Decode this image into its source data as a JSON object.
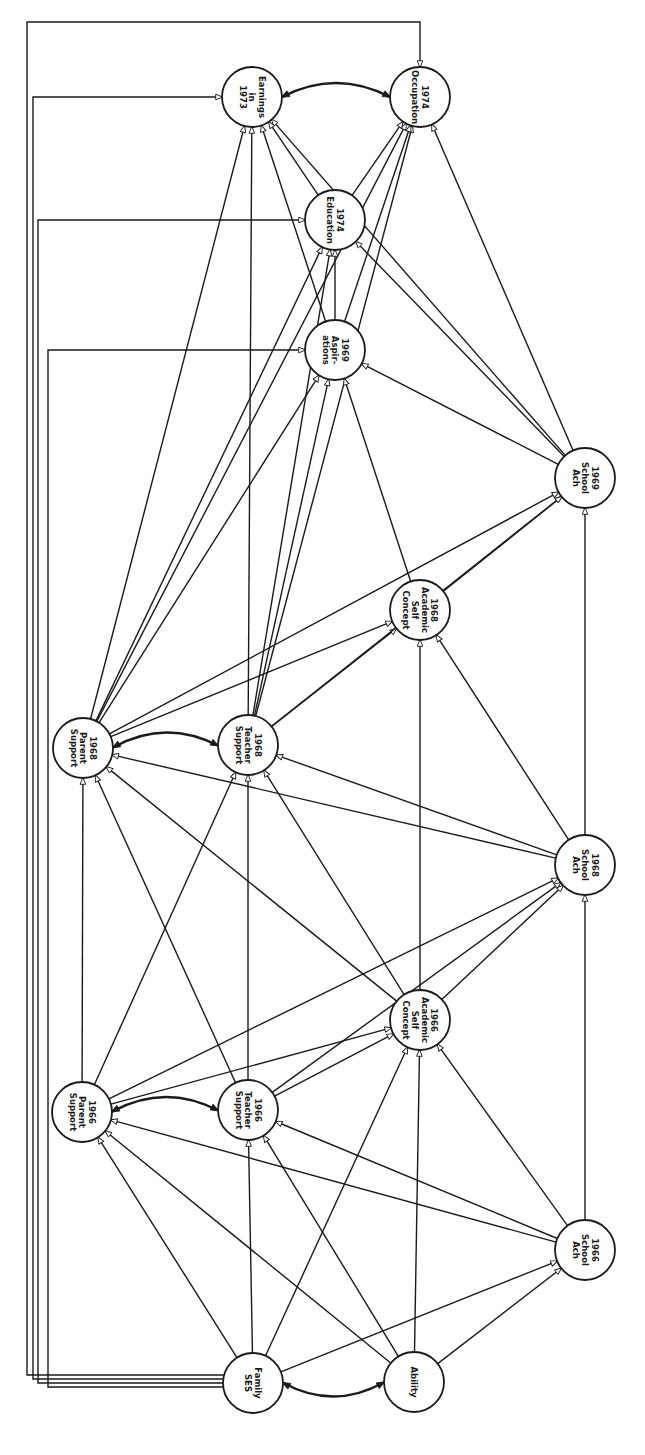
{
  "diagram": {
    "type": "path-diagram",
    "orientation": "rotated-90-clockwise",
    "nodes": [
      {
        "id": "ses",
        "lines": [
          "Family",
          "SES"
        ],
        "cx": 253,
        "cy": 1383
      },
      {
        "id": "ability",
        "lines": [
          "Ability"
        ],
        "cx": 414,
        "cy": 1382
      },
      {
        "id": "ps66",
        "lines": [
          "1966",
          "Parent",
          "Support"
        ],
        "cx": 82,
        "cy": 1112
      },
      {
        "id": "ts66",
        "lines": [
          "1966",
          "Teacher",
          "Support"
        ],
        "cx": 248,
        "cy": 1110
      },
      {
        "id": "asc66",
        "lines": [
          "1966",
          "Academic",
          "Self",
          "Concept"
        ],
        "cx": 420,
        "cy": 1020
      },
      {
        "id": "sa66",
        "lines": [
          "1966",
          "School",
          "Ach"
        ],
        "cx": 585,
        "cy": 1250
      },
      {
        "id": "ps68",
        "lines": [
          "1968",
          "Parent",
          "Support"
        ],
        "cx": 83,
        "cy": 748
      },
      {
        "id": "ts68",
        "lines": [
          "1968",
          "Teacher",
          "Support"
        ],
        "cx": 248,
        "cy": 745
      },
      {
        "id": "asc68",
        "lines": [
          "1968",
          "Academic",
          "Self",
          "Concept"
        ],
        "cx": 420,
        "cy": 610
      },
      {
        "id": "sa68",
        "lines": [
          "1968",
          "School",
          "Ach"
        ],
        "cx": 585,
        "cy": 865
      },
      {
        "id": "sa69",
        "lines": [
          "1969",
          "School",
          "Ach"
        ],
        "cx": 585,
        "cy": 478
      },
      {
        "id": "asp69",
        "lines": [
          "1969",
          "Aspir-",
          "ations"
        ],
        "cx": 335,
        "cy": 350
      },
      {
        "id": "edu74",
        "lines": [
          "1974",
          "Education"
        ],
        "cx": 335,
        "cy": 220
      },
      {
        "id": "earn73",
        "lines": [
          "Earnings",
          "in",
          "1973"
        ],
        "cx": 252,
        "cy": 97
      },
      {
        "id": "occ74",
        "lines": [
          "1974",
          "Occupation"
        ],
        "cx": 420,
        "cy": 97
      }
    ],
    "edges": [
      [
        "ses",
        "ps66"
      ],
      [
        "ses",
        "ts66"
      ],
      [
        "ses",
        "asc66"
      ],
      [
        "ses",
        "sa66"
      ],
      [
        "ability",
        "ps66"
      ],
      [
        "ability",
        "ts66"
      ],
      [
        "ability",
        "asc66"
      ],
      [
        "ability",
        "sa66"
      ],
      [
        "sa66",
        "ps66"
      ],
      [
        "sa66",
        "ts66"
      ],
      [
        "sa66",
        "asc66"
      ],
      [
        "sa66",
        "sa68"
      ],
      [
        "ps66",
        "ps68"
      ],
      [
        "ps66",
        "ts68"
      ],
      [
        "ps66",
        "asc66"
      ],
      [
        "ps66",
        "sa68"
      ],
      [
        "ts66",
        "ps68"
      ],
      [
        "ts66",
        "ts68"
      ],
      [
        "ts66",
        "asc66"
      ],
      [
        "ts66",
        "sa68"
      ],
      [
        "asc66",
        "ps68"
      ],
      [
        "asc66",
        "ts68"
      ],
      [
        "asc66",
        "asc68"
      ],
      [
        "asc66",
        "sa68"
      ],
      [
        "sa68",
        "ps68"
      ],
      [
        "sa68",
        "ts68"
      ],
      [
        "sa68",
        "asc68"
      ],
      [
        "sa68",
        "sa69"
      ],
      [
        "ps68",
        "asc68"
      ],
      [
        "ps68",
        "sa69"
      ],
      [
        "ps68",
        "asp69"
      ],
      [
        "ps68",
        "edu74"
      ],
      [
        "ps68",
        "earn73"
      ],
      [
        "ps68",
        "occ74"
      ],
      [
        "ts68",
        "asc68"
      ],
      [
        "ts68",
        "sa69"
      ],
      [
        "ts68",
        "asp69"
      ],
      [
        "ts68",
        "edu74"
      ],
      [
        "ts68",
        "earn73"
      ],
      [
        "ts68",
        "occ74"
      ],
      [
        "asc68",
        "sa69"
      ],
      [
        "asc68",
        "asp69"
      ],
      [
        "sa69",
        "asp69"
      ],
      [
        "sa69",
        "edu74"
      ],
      [
        "sa69",
        "earn73"
      ],
      [
        "sa69",
        "occ74"
      ],
      [
        "asp69",
        "edu74"
      ],
      [
        "asp69",
        "earn73"
      ],
      [
        "asp69",
        "occ74"
      ],
      [
        "edu74",
        "earn73"
      ],
      [
        "edu74",
        "occ74"
      ]
    ],
    "correlations": [
      [
        "ses",
        "ability"
      ],
      [
        "ps66",
        "ts66"
      ],
      [
        "ps68",
        "ts68"
      ],
      [
        "earn73",
        "occ74"
      ]
    ],
    "bracket_paths": [
      {
        "from": "ses",
        "to": "occ74",
        "x": 27
      },
      {
        "from": "ses",
        "to": "earn73",
        "x": 33
      },
      {
        "from": "ses",
        "to": "edu74",
        "x": 38
      },
      {
        "from": "ses",
        "to": "asp69",
        "x": 48
      }
    ]
  }
}
